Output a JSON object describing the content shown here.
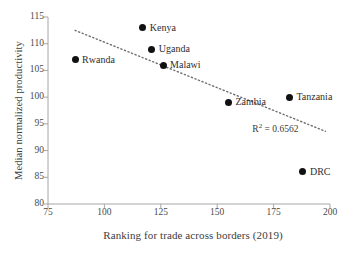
{
  "chart_data": {
    "type": "scatter",
    "title": "",
    "xlabel": "Ranking for trade across borders (2019)",
    "ylabel": "Median normalized productivity",
    "xlim": [
      75,
      200
    ],
    "ylim": [
      80,
      115
    ],
    "xticks": [
      75,
      100,
      125,
      150,
      175,
      200
    ],
    "yticks": [
      80,
      85,
      90,
      95,
      100,
      105,
      110,
      115
    ],
    "grid": false,
    "legend": "none",
    "points": [
      {
        "label": "Rwanda",
        "x": 87,
        "y": 107,
        "label_side": "right"
      },
      {
        "label": "Kenya",
        "x": 117,
        "y": 113,
        "label_side": "right"
      },
      {
        "label": "Uganda",
        "x": 121,
        "y": 109,
        "label_side": "right"
      },
      {
        "label": "Malawi",
        "x": 126,
        "y": 106,
        "label_side": "right"
      },
      {
        "label": "Zambia",
        "x": 155,
        "y": 99,
        "label_side": "right"
      },
      {
        "label": "Tanzania",
        "x": 182,
        "y": 100,
        "label_side": "right"
      },
      {
        "label": "DRC",
        "x": 188,
        "y": 86,
        "label_side": "right"
      }
    ],
    "trendline": {
      "style": "dotted",
      "x_start": 87,
      "y_start": 112.5,
      "x_end": 198,
      "y_end": 93.6,
      "r_squared": 0.6562,
      "annotation": "R² = 0.6562"
    },
    "annotation_parts": {
      "r_prefix": "R",
      "r_sup": "2",
      "r_value": " = 0.6562"
    },
    "colors": {
      "marker": "#111111",
      "axis": "#a6a6a6",
      "text": "#3a3a3a",
      "background": "#ffffff"
    }
  }
}
